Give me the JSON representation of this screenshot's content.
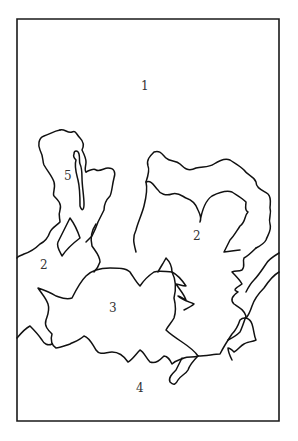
{
  "figure": {
    "type": "region map line drawing",
    "border_color": "#1a1a1a",
    "background": "#ffffff",
    "regions": [
      {
        "id": "region-1",
        "label": "1",
        "x": 144,
        "y": 82
      },
      {
        "id": "region-2-left",
        "label": "2",
        "x": 43,
        "y": 262
      },
      {
        "id": "region-2-right",
        "label": "2",
        "x": 195,
        "y": 232
      },
      {
        "id": "region-3",
        "label": "3",
        "x": 111,
        "y": 304
      },
      {
        "id": "region-4",
        "label": "4",
        "x": 138,
        "y": 384
      },
      {
        "id": "region-5",
        "label": "5",
        "x": 66,
        "y": 172
      }
    ]
  }
}
